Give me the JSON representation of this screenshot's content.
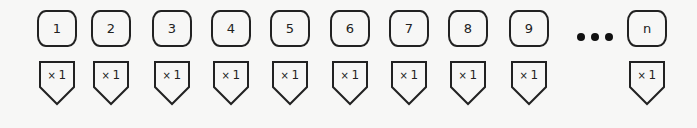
{
  "diagram": {
    "stroke_color": "#222222",
    "background_color": "#f7f7f6",
    "items": [
      {
        "label": "1",
        "multiplier_sign": "×",
        "multiplier_value": "1",
        "x": 37
      },
      {
        "label": "2",
        "multiplier_sign": "×",
        "multiplier_value": "1",
        "x": 91
      },
      {
        "label": "3",
        "multiplier_sign": "×",
        "multiplier_value": "1",
        "x": 152
      },
      {
        "label": "4",
        "multiplier_sign": "×",
        "multiplier_value": "1",
        "x": 211
      },
      {
        "label": "5",
        "multiplier_sign": "×",
        "multiplier_value": "1",
        "x": 270
      },
      {
        "label": "6",
        "multiplier_sign": "×",
        "multiplier_value": "1",
        "x": 330
      },
      {
        "label": "7",
        "multiplier_sign": "×",
        "multiplier_value": "1",
        "x": 389
      },
      {
        "label": "8",
        "multiplier_sign": "×",
        "multiplier_value": "1",
        "x": 448
      },
      {
        "label": "9",
        "multiplier_sign": "×",
        "multiplier_value": "1",
        "x": 509
      },
      {
        "label": "n",
        "multiplier_sign": "×",
        "multiplier_value": "1",
        "x": 627
      }
    ],
    "ellipsis": {
      "icon": "ellipsis-dots-icon",
      "count": 3
    }
  }
}
